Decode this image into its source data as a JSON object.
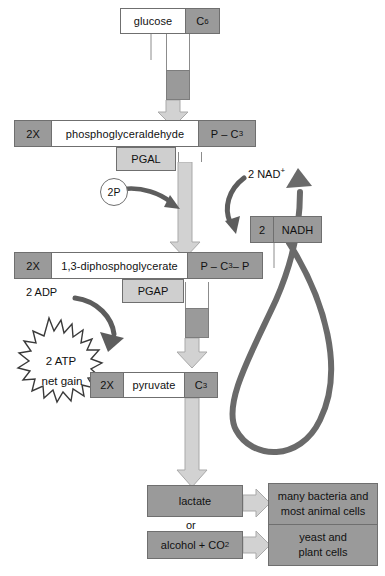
{
  "diagram": {
    "colors": {
      "fill_dark": "#9a9a9a",
      "fill_light": "#cfcfcf",
      "arrow_light": "#d2d2d2",
      "arrow_dark": "#6a6a6a",
      "stroke": "#6f6f6f",
      "background": "#ffffff"
    },
    "steps": [
      {
        "name": "glucose",
        "count": "",
        "label": "glucose",
        "carbon": "C",
        "carbon_sub": "6",
        "enzyme": ""
      },
      {
        "name": "phosphoglyceraldehyde",
        "count": "2X",
        "label": "phosphoglyceraldehyde",
        "carbon": "P – C",
        "carbon_sub": "3",
        "carbon_tail": "",
        "enzyme": "PGAL"
      },
      {
        "name": "1,3-diphosphoglycerate",
        "count": "2X",
        "label": "1,3-diphosphoglycerate",
        "carbon": "P – C",
        "carbon_sub": "3",
        "carbon_tail": " – P",
        "enzyme": "PGAP"
      },
      {
        "name": "pyruvate",
        "count": "2X",
        "label": "pyruvate",
        "carbon": "C",
        "carbon_sub": "3",
        "carbon_tail": "",
        "enzyme": ""
      }
    ],
    "cofactors": {
      "phosphate_label": "2P",
      "nad_label": "2 NAD",
      "nad_charge": "+",
      "nadh_count": "2",
      "nadh_label": "NADH",
      "adp_label": "2 ADP",
      "atp_label": "2 ATP",
      "atp_note": "net gain"
    },
    "products": [
      {
        "name": "lactate",
        "label": "lactate",
        "organisms_line1": "many bacteria and",
        "organisms_line2": "most animal cells"
      },
      {
        "name": "alcohol",
        "label": "alcohol + CO",
        "label_sub": "2",
        "organisms_line1": "yeast and",
        "organisms_line2": "plant cells"
      }
    ],
    "connector_or": "or"
  }
}
